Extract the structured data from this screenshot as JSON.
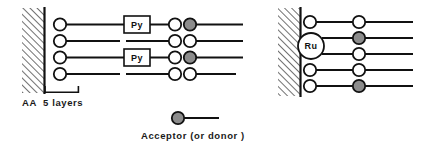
{
  "figure": {
    "background_color": "#ffffff",
    "line_color": "#111111",
    "hatch_color": "#333333",
    "circle_stroke": "#111111",
    "open_circle_fill": "#ffffff",
    "filled_circle_fill": "#8c8c8c"
  },
  "left_panel": {
    "substrate": {
      "name": "hatched-substrate"
    },
    "scale_bracket": {
      "name": "layer-bracket"
    },
    "caption": "AA  5 layers",
    "chains": [
      {
        "index": 0,
        "anchor_circle": "open",
        "box_label": "Py",
        "mid_circle": "open",
        "end_circle": "filled"
      },
      {
        "index": 1,
        "anchor_circle": "open",
        "box_label": "",
        "mid_circle": "open",
        "end_circle": "open"
      },
      {
        "index": 2,
        "anchor_circle": "open",
        "box_label": "Py",
        "mid_circle": "open",
        "end_circle": "filled"
      },
      {
        "index": 3,
        "anchor_circle": "open",
        "box_label": "",
        "mid_circle": "open",
        "end_circle": "open"
      }
    ]
  },
  "right_panel": {
    "substrate": {
      "name": "hatched-substrate"
    },
    "complex_label": "Ru",
    "chains": [
      {
        "index": 0,
        "anchor_circle": "open",
        "end_circle": "open"
      },
      {
        "index": 1,
        "anchor_circle": "ru",
        "end_circle": "filled"
      },
      {
        "index": 2,
        "anchor_circle": "ru",
        "end_circle": "open"
      },
      {
        "index": 3,
        "anchor_circle": "open",
        "end_circle": "open"
      },
      {
        "index": 4,
        "anchor_circle": "open",
        "end_circle": "filled"
      }
    ]
  },
  "legend": {
    "marker": "filled-circle-with-tail",
    "label": "Acceptor (or donor )"
  }
}
